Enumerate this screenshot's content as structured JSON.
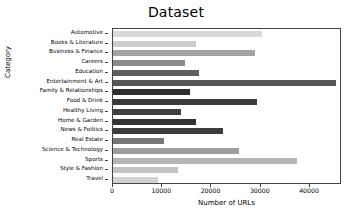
{
  "chart_data": {
    "type": "bar",
    "orientation": "horizontal",
    "title": "Dataset",
    "xlabel": "Number of URLs",
    "ylabel": "Category",
    "categories": [
      "Automotive",
      "Books & Literature",
      "Business & Finance",
      "Careers",
      "Education",
      "Entertainment & Art",
      "Family & Relationships",
      "Food & Drink",
      "Healthy Living",
      "Home & Garden",
      "News & Politics",
      "Real Estate",
      "Science & Technology",
      "Sports",
      "Style & Fashion",
      "Travel"
    ],
    "values": [
      30200,
      16800,
      28800,
      14600,
      17500,
      45200,
      15600,
      29200,
      13900,
      16800,
      22300,
      10400,
      25500,
      37300,
      13200,
      9100
    ],
    "bar_colors": [
      "#d9d9d9",
      "#cccccc",
      "#a3a3a3",
      "#8a8a8a",
      "#5e5e5e",
      "#565656",
      "#2e2e2e",
      "#3b3b3b",
      "#3f3f3f",
      "#333333",
      "#3d3d3d",
      "#777777",
      "#9e9e9e",
      "#b5b5b5",
      "#c4c4c4",
      "#d2d2d2"
    ],
    "xlim": [
      0,
      46500
    ],
    "xticks": [
      0,
      10000,
      20000,
      30000,
      40000
    ],
    "xtick_labels": [
      "0",
      "10000",
      "20000",
      "30000",
      "40000"
    ],
    "grid": false,
    "legend": "none",
    "axis_color": "#444444",
    "background_color": "#ffffff"
  }
}
